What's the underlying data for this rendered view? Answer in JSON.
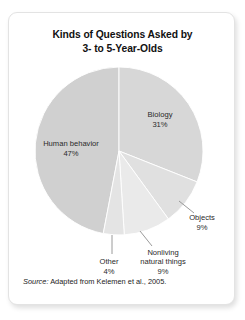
{
  "figure": {
    "title_line_1": "Kinds of Questions Asked by",
    "title_line_2": "3- to 5-Year-Olds",
    "source_word": "Source:",
    "source_text": " Adapted from Kelemen et al., 2005."
  },
  "chart_data": {
    "type": "pie",
    "title": "Kinds of Questions Asked by 3- to 5-Year-Olds",
    "xlabel": "",
    "ylabel": "",
    "units": "percent",
    "total": 100,
    "start_angle_deg": 0,
    "direction": "clockwise",
    "legend": "none",
    "grid": false,
    "labels_inline": true,
    "categories": [
      "Biology",
      "Objects",
      "Nonliving natural things",
      "Other",
      "Human behavior"
    ],
    "values": [
      31,
      9,
      9,
      4,
      47
    ],
    "slices": [
      {
        "label": "Biology",
        "value": 31,
        "value_text": "31%",
        "color": "#d7d7d7",
        "label_placement": "inside",
        "leader_line": false
      },
      {
        "label": "Objects",
        "value": 9,
        "value_text": "9%",
        "color": "#e0e0e0",
        "label_placement": "outside",
        "leader_line": true
      },
      {
        "label": "Nonliving natural things",
        "value": 9,
        "value_text": "9%",
        "label_line_1": "Nonliving",
        "label_line_2": "natural things",
        "color": "#eaeaea",
        "label_placement": "outside",
        "leader_line": true
      },
      {
        "label": "Other",
        "value": 4,
        "value_text": "4%",
        "color": "#e4e4e4",
        "label_placement": "outside",
        "leader_line": true
      },
      {
        "label": "Human behavior",
        "value": 47,
        "value_text": "47%",
        "color": "#d0d0d0",
        "label_placement": "inside",
        "leader_line": false
      }
    ],
    "colors": {
      "card_background": "#ffffff",
      "card_border": "#e3e3e3",
      "title_text": "#111111",
      "label_text": "#2a2a2a",
      "leader_line": "#8e8e8e",
      "slice_divider": "#ffffff"
    }
  }
}
